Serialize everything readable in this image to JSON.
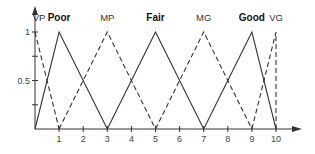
{
  "chart_data": {
    "type": "line",
    "title": "",
    "xlabel": "",
    "ylabel": "",
    "xlim": [
      0,
      10
    ],
    "ylim": [
      0,
      1
    ],
    "grid": false,
    "x_ticks": [
      "1",
      "2",
      "3",
      "4",
      "5",
      "6",
      "7",
      "8",
      "9",
      "10"
    ],
    "y_ticks": [
      "0.5",
      "1"
    ],
    "series": [
      {
        "name": "VP",
        "style": "dashed",
        "bold_label": false,
        "x": [
          0,
          1
        ],
        "y": [
          1,
          0
        ]
      },
      {
        "name": "Poor",
        "style": "solid",
        "bold_label": true,
        "x": [
          0,
          1,
          3
        ],
        "y": [
          0,
          1,
          0
        ]
      },
      {
        "name": "MP",
        "style": "dashed",
        "bold_label": false,
        "x": [
          1,
          3,
          5
        ],
        "y": [
          0,
          1,
          0
        ]
      },
      {
        "name": "Fair",
        "style": "solid",
        "bold_label": true,
        "x": [
          3,
          5,
          7
        ],
        "y": [
          0,
          1,
          0
        ]
      },
      {
        "name": "MG",
        "style": "dashed",
        "bold_label": false,
        "x": [
          5,
          7,
          9
        ],
        "y": [
          0,
          1,
          0
        ]
      },
      {
        "name": "Good",
        "style": "solid",
        "bold_label": true,
        "x": [
          7,
          9,
          10
        ],
        "y": [
          0,
          1,
          0
        ]
      },
      {
        "name": "VG",
        "style": "dashed",
        "bold_label": false,
        "x": [
          9,
          10,
          10
        ],
        "y": [
          0,
          1,
          0
        ]
      }
    ],
    "colors": {
      "line": "#333333",
      "axis": "#333333"
    }
  }
}
